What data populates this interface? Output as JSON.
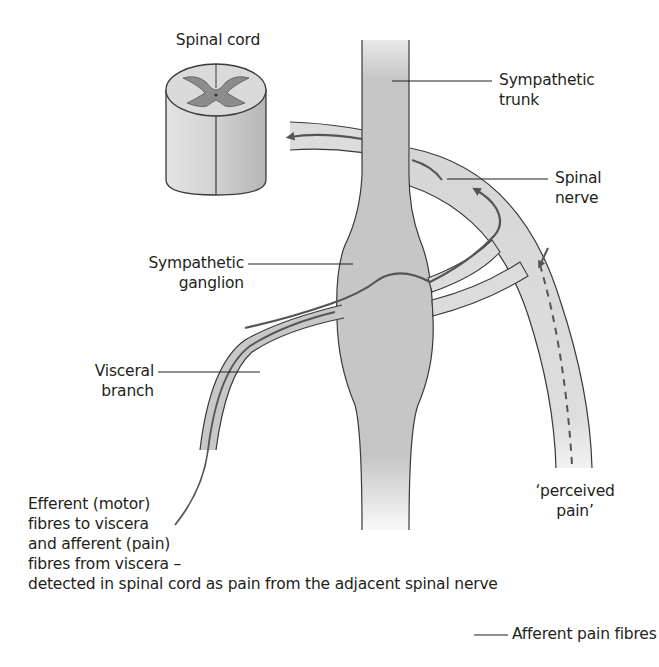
{
  "diagram": {
    "labels": {
      "spinal_cord": "Spinal cord",
      "sympathetic_trunk": [
        "Sympathetic",
        "trunk"
      ],
      "spinal_nerve": [
        "Spinal",
        "nerve"
      ],
      "sympathetic_ganglion": [
        "Sympathetic",
        "ganglion"
      ],
      "visceral_branch": [
        "Visceral",
        "branch"
      ],
      "perceived_pain": [
        "‘perceived",
        "pain’"
      ],
      "efferent_note": [
        "Efferent (motor)",
        "fibres to viscera",
        "and afferent (pain)",
        "fibres from viscera –",
        "detected in spinal cord as pain from the adjacent spinal nerve"
      ]
    },
    "legend": {
      "items": [
        {
          "symbol": "solid-line",
          "label": "Afferent pain fibres"
        }
      ]
    },
    "colors": {
      "structure_fill": "#c8c8c8",
      "nerve_fill": "#dcdcdc",
      "outline": "#3a3a3a",
      "fibre": "#555555",
      "grey_matter": "#8c8c8c"
    }
  }
}
